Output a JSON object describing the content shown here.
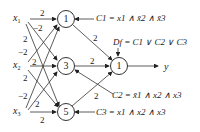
{
  "inputs": [
    {
      "name": "x",
      "sub": "1"
    },
    {
      "name": "x",
      "sub": "2"
    },
    {
      "name": "x",
      "sub": "3"
    }
  ],
  "hidden_nodes": [
    "1",
    "3",
    "5"
  ],
  "output_node": "1",
  "output_label": "y",
  "weights": {
    "x1_n1": "2",
    "x1_n3": "−2",
    "x1_n5": "2",
    "x2_n1": "−2",
    "x2_n3": "2",
    "x2_n5": "2",
    "x3_n1": "−2",
    "x3_n3": "2",
    "x3_n5": "2",
    "n1_out": "2",
    "n3_out": "2",
    "n5_out": "2"
  },
  "equations": {
    "c1": "C1 = x1 ∧ x̄2 ∧ x̄3",
    "c2": "C2 = x̄1 ∧ x2 ∧ x3",
    "c3": "C3 = x1 ∧ x2 ∧ x3",
    "df": "Df = C1 ∨ C2 ∨ C3"
  }
}
